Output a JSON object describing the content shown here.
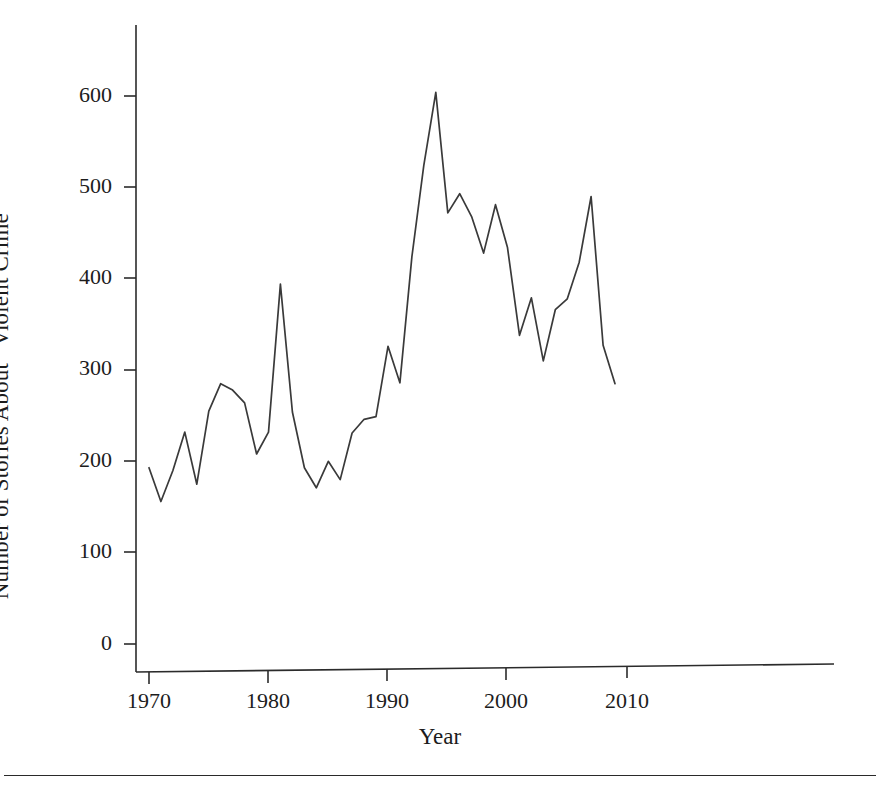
{
  "chart_data": {
    "type": "line",
    "title": "",
    "xlabel": "Year",
    "ylabel": "Number of Stories About “Violent Crime”",
    "xlim": [
      1969,
      2010.5
    ],
    "ylim": [
      0,
      660
    ],
    "xticks": [
      1970,
      1980,
      1990,
      2000,
      2010
    ],
    "xtick_labels": [
      "1970",
      "1980",
      "1990",
      "2000",
      "2010"
    ],
    "yticks": [
      0,
      100,
      200,
      300,
      400,
      500,
      600
    ],
    "ytick_labels": [
      "0",
      "100",
      "200",
      "300",
      "400",
      "500",
      "600"
    ],
    "grid": false,
    "legend": false,
    "line_color": "#3a3a3a",
    "x": [
      1970,
      1971,
      1972,
      1973,
      1974,
      1975,
      1976,
      1977,
      1978,
      1979,
      1980,
      1981,
      1982,
      1983,
      1984,
      1985,
      1986,
      1987,
      1988,
      1989,
      1990,
      1991,
      1992,
      1993,
      1994,
      1995,
      1996,
      1997,
      1998,
      1999,
      2000,
      2001,
      2002,
      2003,
      2004,
      2005,
      2006,
      2007,
      2008,
      2009
    ],
    "values": [
      193,
      156,
      190,
      232,
      175,
      255,
      285,
      278,
      264,
      208,
      232,
      394,
      254,
      193,
      171,
      200,
      180,
      231,
      246,
      249,
      326,
      286,
      424,
      524,
      604,
      472,
      493,
      468,
      428,
      481,
      434,
      338,
      379,
      310,
      366,
      378,
      418,
      490,
      327,
      285
    ]
  },
  "axis": {
    "x_label": "Year",
    "y_label": "Number of Stories About “Violent Crime”",
    "y_ticks": [
      "600",
      "500",
      "400",
      "300",
      "200",
      "100",
      "0"
    ],
    "x_ticks": [
      "1970",
      "1980",
      "1990",
      "2000",
      "2010"
    ]
  }
}
